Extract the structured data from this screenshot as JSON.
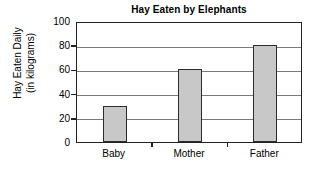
{
  "chart_data": {
    "type": "bar",
    "title": "Hay Eaten by Elephants",
    "xlabel": "",
    "ylabel_lines": [
      "Hay Eaten Daily",
      "(in kilograms)"
    ],
    "ylabel": "Hay Eaten Daily (in kilograms)",
    "categories": [
      "Baby",
      "Mother",
      "Father"
    ],
    "values": [
      30,
      60,
      80
    ],
    "yticks": [
      0,
      20,
      40,
      60,
      80,
      100
    ],
    "ytick_labels": [
      "0",
      "20",
      "40",
      "60",
      "80",
      "100"
    ],
    "ylim": [
      0,
      100
    ],
    "grid": true,
    "legend": false,
    "bar_color": "#c8c8c8",
    "bar_edge_color": "#2b2b2b",
    "gridline_color": "#7a7a7a",
    "frame_color": "#222222",
    "background_color": "#ffffff"
  }
}
